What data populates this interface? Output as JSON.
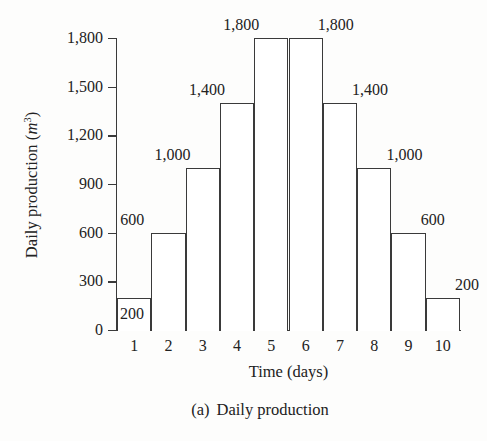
{
  "chart_data": {
    "type": "bar",
    "title": "",
    "caption_index": "(a)",
    "caption_text": "Daily production",
    "xlabel": "Time (days)",
    "ylabel_text": "Daily production (",
    "ylabel_unit": "m",
    "ylabel_exponent": "3",
    "ylabel_close": ")",
    "ylabel_full": "Daily production (m3)",
    "categories": [
      "1",
      "2",
      "3",
      "4",
      "5",
      "6",
      "7",
      "8",
      "9",
      "10"
    ],
    "values": [
      200,
      600,
      1000,
      1400,
      1800,
      1800,
      1400,
      1000,
      600,
      200
    ],
    "value_labels": [
      "200",
      "600",
      "1,000",
      "1,400",
      "1,800",
      "1,800",
      "1,400",
      "1,000",
      "600",
      "200"
    ],
    "ylim": [
      0,
      1800
    ],
    "y_ticks": [
      0,
      300,
      600,
      900,
      1200,
      1500,
      1800
    ],
    "y_tick_labels": [
      "0",
      "300",
      "600",
      "900",
      "1,200",
      "1,500",
      "1,800"
    ],
    "grid": false,
    "legend": false,
    "bar_fill": "#ffffff",
    "bar_stroke": "#3a3a3a",
    "axis_color": "#3a3a3a",
    "background": "#fdfdfc",
    "text_color": "#222222",
    "label_placement": [
      "inside",
      "above-left",
      "above-left",
      "above-left",
      "above-left",
      "above-right",
      "above-right",
      "above-right",
      "above-right",
      "above-right"
    ]
  }
}
